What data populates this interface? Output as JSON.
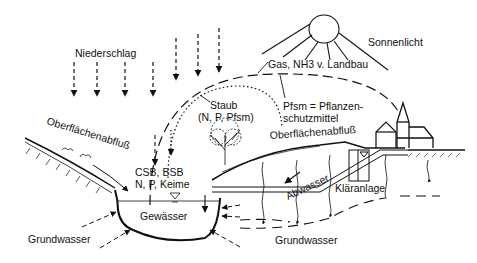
{
  "diagram": {
    "background": "#ffffff",
    "ink_color": "#111111",
    "labels": {
      "precipitation": "Niederschlag",
      "sunlight": "Sonnenlicht",
      "gas": "Gas, NH3 v. Landbau",
      "dust_title": "Staub",
      "dust_detail": "(N, P, Pfsm)",
      "pfsm_line1": "Pfsm = Pflanzen-",
      "pfsm_line2": "schutzmittel",
      "runoff_left": "Oberflächenabfluß",
      "runoff_right": "Oberflächenabfluß",
      "pollutants_line1": "CSB, BSB",
      "pollutants_line2": "N, P, Keime",
      "water_body": "Gewässer",
      "wastewater": "Abwasser",
      "treatment_plant": "Kläranlage",
      "groundwater_left": "Grundwasser",
      "groundwater_right": "Grundwasser"
    },
    "icons": {
      "sun": "sun-icon",
      "church": "church-icon",
      "house": "house-icon",
      "tree": "tree-icon",
      "water_level": "water-level-triangle-icon"
    }
  }
}
